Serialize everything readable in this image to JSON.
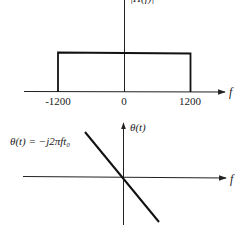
{
  "top_plot": {
    "ylabel": "|H(f)|",
    "xlabel": "f",
    "ticks": [
      "-1200",
      "0",
      "1200"
    ],
    "shape": "rectangle",
    "passband": [
      -1200,
      1200
    ]
  },
  "bottom_plot": {
    "ylabel": "θ(t)",
    "xlabel": "f",
    "equation": "θ(t) = −j2πft₀",
    "shape": "line",
    "slope": "negative"
  },
  "colors": {
    "line": "#111111",
    "axis": "#222222",
    "background": "#ffffff"
  }
}
